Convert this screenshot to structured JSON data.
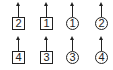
{
  "diagram": {
    "top_row": [
      {
        "label": "2",
        "shape": "square"
      },
      {
        "label": "1",
        "shape": "square"
      },
      {
        "label": "1",
        "shape": "circle"
      },
      {
        "label": "2",
        "shape": "circle"
      }
    ],
    "bottom_row": [
      {
        "label": "4",
        "shape": "square"
      },
      {
        "label": "3",
        "shape": "square"
      },
      {
        "label": "3",
        "shape": "circle"
      },
      {
        "label": "4",
        "shape": "circle"
      }
    ],
    "arrow_direction": "up",
    "stroke_color": "#222222"
  }
}
